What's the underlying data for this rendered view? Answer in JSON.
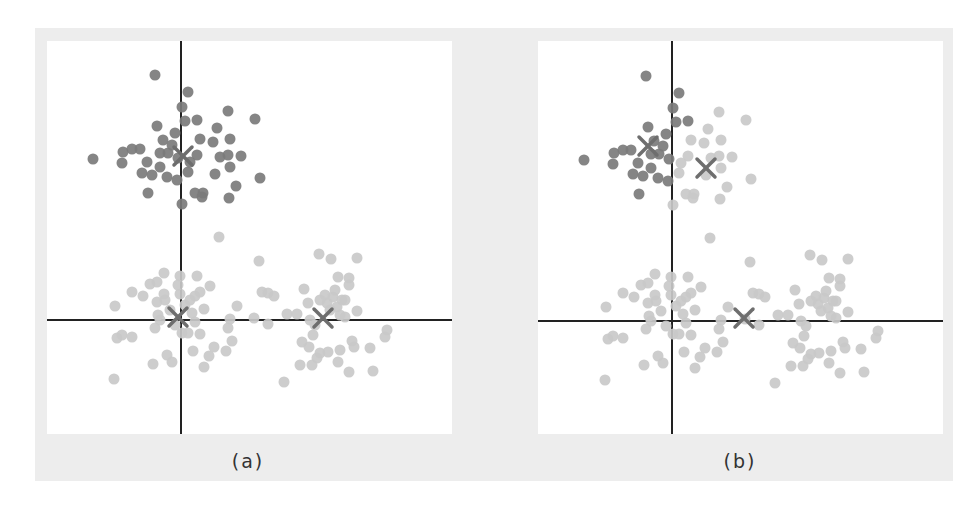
{
  "figure": {
    "colors": {
      "frame": "#ededed",
      "panel": "#ffffff",
      "axis": "#222222",
      "cluster_dark": "#7b7b7b",
      "cluster_light": "#c9c9c9",
      "centroid": "#6e6e6e"
    },
    "panels": [
      {
        "id": "a",
        "caption": "(a)",
        "description": "K-means with k=3: one centroid per true cluster"
      },
      {
        "id": "b",
        "caption": "(b)",
        "description": "K-means with k=3: two centroids split the top cluster, one centroid between the two bottom clusters"
      }
    ]
  },
  "chart_data": [
    {
      "type": "scatter",
      "title": "(a)",
      "axes": {
        "x_axis_at_y": 0,
        "y_axis_at_x": 0,
        "ticks": "none",
        "grid": false
      },
      "note": "points in panel pixel coords relative to panel origin; centroid markers shown as X",
      "centroids": [
        {
          "x": 136,
          "y": 115,
          "cluster": "top"
        },
        {
          "x": 131,
          "y": 276,
          "cluster": "bottom-left"
        },
        {
          "x": 276,
          "y": 277,
          "cluster": "bottom-right"
        }
      ]
    },
    {
      "type": "scatter",
      "title": "(b)",
      "axes": {
        "x_axis_at_y": 0,
        "y_axis_at_x": 0,
        "ticks": "none",
        "grid": false
      },
      "centroids": [
        {
          "x": 110,
          "y": 105,
          "cluster": "top-left (dark)"
        },
        {
          "x": 168,
          "y": 127,
          "cluster": "top-right + bottom (light)"
        },
        {
          "x": 206,
          "y": 277,
          "cluster": "bottom (light)"
        }
      ]
    }
  ],
  "points": {
    "top": [
      [
        155,
        75,
        "d"
      ],
      [
        188,
        92,
        "d"
      ],
      [
        182,
        107,
        "d"
      ],
      [
        228,
        111,
        "l"
      ],
      [
        255,
        119,
        "l"
      ],
      [
        185,
        121,
        "d"
      ],
      [
        197,
        120,
        "d"
      ],
      [
        157,
        126,
        "d"
      ],
      [
        217,
        128,
        "l"
      ],
      [
        175,
        133,
        "d"
      ],
      [
        163,
        140,
        "d"
      ],
      [
        200,
        139,
        "l"
      ],
      [
        213,
        142,
        "l"
      ],
      [
        230,
        139,
        "l"
      ],
      [
        123,
        152,
        "d"
      ],
      [
        132,
        149,
        "d"
      ],
      [
        140,
        149,
        "d"
      ],
      [
        93,
        159,
        "d"
      ],
      [
        122,
        163,
        "d"
      ],
      [
        147,
        162,
        "d"
      ],
      [
        160,
        153,
        "d"
      ],
      [
        168,
        153,
        "d"
      ],
      [
        197,
        155,
        "l"
      ],
      [
        220,
        157,
        "l"
      ],
      [
        228,
        155,
        "l"
      ],
      [
        241,
        156,
        "l"
      ],
      [
        230,
        167,
        "l"
      ],
      [
        160,
        167,
        "d"
      ],
      [
        142,
        173,
        "d"
      ],
      [
        152,
        175,
        "d"
      ],
      [
        167,
        177,
        "d"
      ],
      [
        177,
        180,
        "d"
      ],
      [
        188,
        172,
        "l"
      ],
      [
        215,
        174,
        "l"
      ],
      [
        260,
        178,
        "l"
      ],
      [
        236,
        186,
        "l"
      ],
      [
        148,
        193,
        "d"
      ],
      [
        195,
        193,
        "l"
      ],
      [
        203,
        193,
        "l"
      ],
      [
        202,
        197,
        "l"
      ],
      [
        229,
        198,
        "l"
      ],
      [
        182,
        204,
        "l"
      ],
      [
        178,
        158,
        "d"
      ],
      [
        190,
        162,
        "l"
      ],
      [
        172,
        145,
        "d"
      ]
    ],
    "bottom_left": [
      [
        219,
        237
      ],
      [
        164,
        273
      ],
      [
        180,
        276
      ],
      [
        197,
        276
      ],
      [
        150,
        284
      ],
      [
        157,
        282
      ],
      [
        132,
        292
      ],
      [
        143,
        296
      ],
      [
        164,
        294
      ],
      [
        180,
        294
      ],
      [
        195,
        296
      ],
      [
        200,
        292
      ],
      [
        210,
        286
      ],
      [
        115,
        306
      ],
      [
        157,
        302
      ],
      [
        204,
        309
      ],
      [
        237,
        306
      ],
      [
        158,
        315
      ],
      [
        192,
        313
      ],
      [
        230,
        319
      ],
      [
        155,
        328
      ],
      [
        228,
        328
      ],
      [
        117,
        338
      ],
      [
        122,
        335
      ],
      [
        132,
        337
      ],
      [
        182,
        333
      ],
      [
        188,
        333
      ],
      [
        200,
        334
      ],
      [
        232,
        341
      ],
      [
        214,
        347
      ],
      [
        193,
        351
      ],
      [
        167,
        355
      ],
      [
        172,
        362
      ],
      [
        153,
        364
      ],
      [
        209,
        356
      ],
      [
        226,
        351
      ],
      [
        204,
        367
      ],
      [
        114,
        379
      ],
      [
        170,
        310
      ],
      [
        185,
        305
      ],
      [
        175,
        325
      ],
      [
        190,
        300
      ],
      [
        165,
        300
      ],
      [
        178,
        285
      ],
      [
        195,
        322
      ],
      [
        160,
        320
      ]
    ],
    "bottom_right": [
      [
        259,
        261
      ],
      [
        262,
        292
      ],
      [
        268,
        293
      ],
      [
        274,
        296
      ],
      [
        254,
        318
      ],
      [
        268,
        324
      ],
      [
        319,
        254
      ],
      [
        331,
        259
      ],
      [
        357,
        258
      ],
      [
        338,
        277
      ],
      [
        349,
        278
      ],
      [
        349,
        285
      ],
      [
        304,
        289
      ],
      [
        325,
        295
      ],
      [
        333,
        297
      ],
      [
        342,
        300
      ],
      [
        308,
        303
      ],
      [
        327,
        303
      ],
      [
        337,
        307
      ],
      [
        357,
        311
      ],
      [
        287,
        314
      ],
      [
        297,
        314
      ],
      [
        345,
        317
      ],
      [
        310,
        320
      ],
      [
        315,
        325
      ],
      [
        313,
        335
      ],
      [
        387,
        330
      ],
      [
        385,
        337
      ],
      [
        302,
        342
      ],
      [
        309,
        347
      ],
      [
        352,
        341
      ],
      [
        354,
        347
      ],
      [
        370,
        348
      ],
      [
        320,
        353
      ],
      [
        328,
        352
      ],
      [
        340,
        350
      ],
      [
        317,
        358
      ],
      [
        338,
        362
      ],
      [
        300,
        365
      ],
      [
        312,
        365
      ],
      [
        349,
        372
      ],
      [
        373,
        371
      ],
      [
        284,
        382
      ],
      [
        330,
        310
      ],
      [
        345,
        300
      ],
      [
        335,
        290
      ],
      [
        320,
        300
      ],
      [
        340,
        315
      ]
    ]
  }
}
